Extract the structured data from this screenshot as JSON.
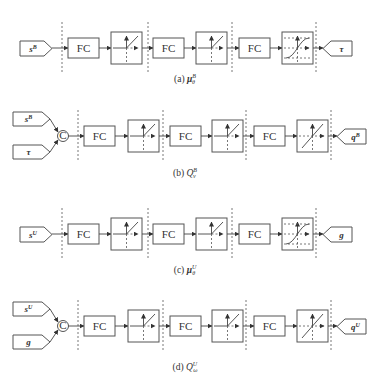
{
  "figure": {
    "panels": [
      {
        "id": "a",
        "caption": "(a) μ_θ^B",
        "caption_prefix": "(a)",
        "caption_symbol": "μ",
        "caption_sup": "B",
        "caption_sub": "θ",
        "inputs": [
          {
            "label": "s",
            "sup": "B"
          }
        ],
        "concat": false,
        "layers": [
          {
            "type": "FC",
            "label": "FC",
            "activation": "relu"
          },
          {
            "type": "FC",
            "label": "FC",
            "activation": "relu"
          },
          {
            "type": "FC",
            "label": "FC",
            "activation": "tanh"
          }
        ],
        "output": {
          "label": "τ",
          "sup": ""
        }
      },
      {
        "id": "b",
        "caption": "(b) Q_ν^B",
        "caption_prefix": "(b)",
        "caption_symbol": "Q",
        "caption_sup": "B",
        "caption_sub": "ν",
        "inputs": [
          {
            "label": "s",
            "sup": "B"
          },
          {
            "label": "τ",
            "sup": ""
          }
        ],
        "concat": true,
        "concat_label": "C",
        "layers": [
          {
            "type": "FC",
            "label": "FC",
            "activation": "relu"
          },
          {
            "type": "FC",
            "label": "FC",
            "activation": "relu"
          },
          {
            "type": "FC",
            "label": "FC",
            "activation": "linear"
          }
        ],
        "output": {
          "label": "q",
          "sup": "B"
        }
      },
      {
        "id": "c",
        "caption": "(c) μ_θ^U",
        "caption_prefix": "(c)",
        "caption_symbol": "μ",
        "caption_sup": "U",
        "caption_sub": "θ",
        "inputs": [
          {
            "label": "s",
            "sup": "U"
          }
        ],
        "concat": false,
        "layers": [
          {
            "type": "FC",
            "label": "FC",
            "activation": "relu"
          },
          {
            "type": "FC",
            "label": "FC",
            "activation": "relu"
          },
          {
            "type": "FC",
            "label": "FC",
            "activation": "tanh"
          }
        ],
        "output": {
          "label": "g",
          "sup": ""
        }
      },
      {
        "id": "d",
        "caption": "(d) Q_ω^U",
        "caption_prefix": "(d)",
        "caption_symbol": "Q",
        "caption_sup": "U",
        "caption_sub": "ω",
        "inputs": [
          {
            "label": "s",
            "sup": "U"
          },
          {
            "label": "g",
            "sup": ""
          }
        ],
        "concat": true,
        "concat_label": "C",
        "layers": [
          {
            "type": "FC",
            "label": "FC",
            "activation": "relu"
          },
          {
            "type": "FC",
            "label": "FC",
            "activation": "relu"
          },
          {
            "type": "FC",
            "label": "FC",
            "activation": "linear"
          }
        ],
        "output": {
          "label": "q",
          "sup": "U"
        }
      }
    ]
  }
}
